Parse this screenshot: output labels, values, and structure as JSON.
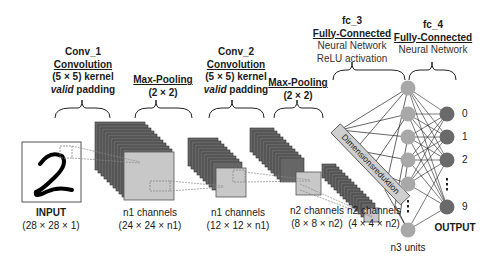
{
  "layers": {
    "conv1": {
      "name": "Conv_1",
      "type": "Convolution",
      "kernel": "(5 × 5) kernel",
      "padding_em": "valid",
      "padding_rest": " padding"
    },
    "pool1": {
      "type": "Max-Pooling",
      "size": "(2 × 2)"
    },
    "conv2": {
      "name": "Conv_2",
      "type": "Convolution",
      "kernel": "(5 × 5) kernel",
      "padding_em": "valid",
      "padding_rest": " padding"
    },
    "pool2": {
      "type": "Max-Pooling",
      "size": "(2 × 2)"
    },
    "fc3": {
      "name": "fc_3",
      "type": "Fully-Connected",
      "line1": "Neural Network",
      "line2": "ReLU activation"
    },
    "fc4": {
      "name": "fc_4",
      "type": "Fully-Connected",
      "line1": "Neural Network"
    }
  },
  "shapes": {
    "input": {
      "title": "INPUT",
      "dims": "(28 × 28 × 1)"
    },
    "s1": {
      "title": "n1 channels",
      "dims": "(24 × 24 × n1)"
    },
    "s2": {
      "title": "n1 channels",
      "dims": "(12 × 12 × n1)"
    },
    "s3": {
      "title": "n2 channels",
      "dims": "(8 × 8 × n2)"
    },
    "s4": {
      "title": "n2 channels",
      "dims": "(4 × 4 × n2)"
    }
  },
  "flatten_label": "Dimensionsreduktion",
  "hidden_units_label": "n3 units",
  "output_label": "OUTPUT",
  "output_digits": [
    "0",
    "1",
    "2",
    "9"
  ],
  "input_digit": "2",
  "colors": {
    "hidden_node": "#a8a8a8",
    "output_node": "#6a6a6a",
    "feature_map": "#c8c8c8",
    "stack_edge": "#555555"
  }
}
